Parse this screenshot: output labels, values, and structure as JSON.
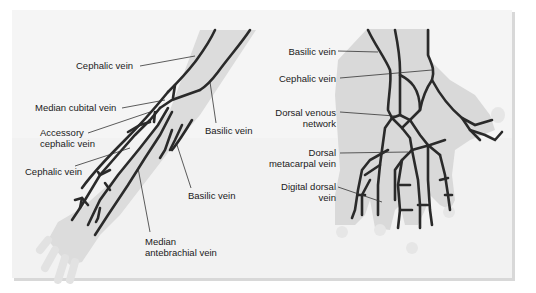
{
  "figure": {
    "left_panel": {
      "title": "Veins of the forearm (anterior view)",
      "labels": {
        "cephalic_upper": "Cephalic vein",
        "median_cubital": "Median cubital vein",
        "accessory_cephalic_1": "Accessory",
        "accessory_cephalic_2": "cephalic vein",
        "cephalic_lower": "Cephalic vein",
        "basilic_upper": "Basilic vein",
        "basilic_lower": "Basilic vein",
        "median_antebrachial_1": "Median",
        "median_antebrachial_2": "antebrachial vein"
      }
    },
    "right_panel": {
      "title": "Veins of the hand (dorsal view)",
      "labels": {
        "basilic": "Basilic vein",
        "cephalic": "Cephalic vein",
        "dorsal_venous_1": "Dorsal venous",
        "dorsal_venous_2": "network",
        "dorsal_metacarpal_1": "Dorsal",
        "dorsal_metacarpal_2": "metacarpal vein",
        "digital_dorsal_1": "Digital dorsal",
        "digital_dorsal_2": "vein"
      }
    },
    "colors": {
      "vein": "#2a2a2a",
      "limb": "#d9d9d9",
      "background": "#f4f4f4",
      "leader": "#333333"
    }
  }
}
